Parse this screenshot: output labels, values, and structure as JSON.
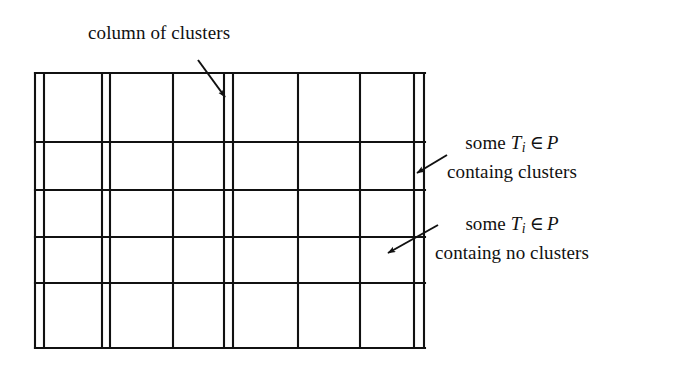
{
  "figure": {
    "title_label": "column of clusters",
    "background_color": "#ffffff",
    "ink_color": "#111111",
    "width": 681,
    "height": 371
  },
  "labels": {
    "column_of_clusters": {
      "text": "column of clusters",
      "arrow": "arrow-down-right"
    },
    "containing_clusters": {
      "line1_prefix": "some ",
      "line1_var": "T",
      "line1_sub": "i",
      "line1_op": "∈",
      "line1_set": "P",
      "line2": "containg clusters",
      "arrow": "arrow-down-left"
    },
    "containing_no_clusters": {
      "line1_prefix": "some ",
      "line1_var": "T",
      "line1_sub": "i",
      "line1_op": "∈",
      "line1_set": "P",
      "line2": "containg no clusters",
      "arrow": "arrow-down-left"
    }
  },
  "diagram_data": {
    "type": "grid-partition",
    "outer": {
      "x0": 35,
      "y0": 73,
      "x1": 425,
      "y1": 348
    },
    "vertical_lines": [
      35,
      44,
      102,
      110,
      173,
      224,
      233,
      298,
      360,
      414,
      424
    ],
    "narrow_column_pairs": [
      [
        35,
        44
      ],
      [
        102,
        110
      ],
      [
        224,
        233
      ],
      [
        414,
        424
      ]
    ],
    "horizontal_lines": [
      73,
      142,
      190,
      237,
      283,
      348
    ],
    "stroke_width": 2.1,
    "arrows": [
      {
        "name": "arrow-to-cluster-column",
        "x1": 198,
        "y1": 60,
        "x2": 226,
        "y2": 99
      },
      {
        "name": "arrow-to-containing-clusters",
        "x1": 445,
        "y1": 156,
        "x2": 416,
        "y2": 173
      },
      {
        "name": "arrow-to-containing-no-clusters",
        "x1": 437,
        "y1": 226,
        "x2": 388,
        "y2": 253
      }
    ]
  }
}
